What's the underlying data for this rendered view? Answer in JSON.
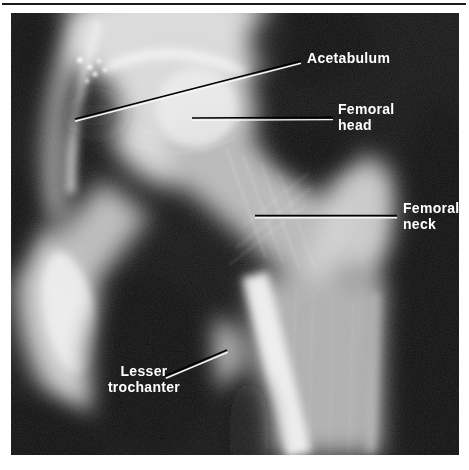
{
  "page": {
    "background_color": "#ffffff",
    "rule_color": "#1b1b1b"
  },
  "figure": {
    "kind": "hip-radiograph",
    "label_color": "#ffffff",
    "leader_line_light": "#f7f7f7",
    "leader_line_dark": "#000000",
    "annotations": [
      {
        "name": "acetabulum",
        "lines": [
          "Acetabulum"
        ]
      },
      {
        "name": "femoral-head",
        "lines": [
          "Femoral",
          "head"
        ]
      },
      {
        "name": "femoral-neck",
        "lines": [
          "Femoral",
          "neck"
        ]
      },
      {
        "name": "lesser-trochanter",
        "lines": [
          "Lesser",
          "trochanter"
        ]
      }
    ]
  }
}
